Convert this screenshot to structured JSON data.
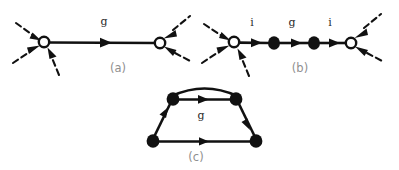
{
  "figure": {
    "background_color": "#ffffff",
    "ink_color": "#111111",
    "caption_color": "#8f8f8f",
    "label_color": "#2b2b2b",
    "width": 399,
    "height": 170
  },
  "panels": [
    {
      "id": "a",
      "caption": "(a)",
      "caption_x": 118,
      "caption_y": 72,
      "description": "two open vertices joined by a single directed edge labelled g",
      "nodes": [
        {
          "name": "open-vertex-left",
          "type": "open",
          "cx": 44,
          "cy": 42,
          "r": 5.2
        },
        {
          "name": "open-vertex-right",
          "type": "open",
          "cx": 160,
          "cy": 43,
          "r": 5.2
        }
      ],
      "edges": [
        {
          "name": "edge-g",
          "label": "g",
          "label_x": 104,
          "label_y": 25,
          "from": [
            49,
            42
          ],
          "to": [
            155,
            43
          ],
          "style": "solid",
          "arrow_at": 0.5,
          "direction": "right"
        }
      ],
      "external_legs": [
        {
          "name": "leg-in-upper-left",
          "style": "dashed",
          "from": [
            16,
            23
          ],
          "to": [
            39,
            39
          ],
          "arrow": "head-at-end"
        },
        {
          "name": "leg-in-lower-left",
          "style": "dashed",
          "from": [
            13,
            62
          ],
          "to": [
            39,
            45
          ],
          "arrow": "head-at-end"
        },
        {
          "name": "leg-in-bottom",
          "style": "dashed",
          "from": [
            58,
            73
          ],
          "to": [
            47,
            47
          ],
          "arrow": "head-at-end"
        },
        {
          "name": "leg-out-upper-right",
          "style": "dashed",
          "from": [
            165,
            40
          ],
          "to": [
            188,
            18
          ],
          "arrow": "head-at-start"
        },
        {
          "name": "leg-out-lower-right",
          "style": "dashed",
          "from": [
            165,
            46
          ],
          "to": [
            190,
            60
          ],
          "arrow": "head-at-start"
        }
      ]
    },
    {
      "id": "b",
      "caption": "(b)",
      "caption_x": 300,
      "caption_y": 72,
      "description": "open vertex, filled vertex, filled vertex, open vertex joined in a chain with edges labelled i, g, i",
      "nodes": [
        {
          "name": "open-vertex-left",
          "type": "open",
          "cx": 234,
          "cy": 42,
          "r": 5.2
        },
        {
          "name": "filled-vertex-one",
          "type": "filled",
          "cx": 274,
          "cy": 43,
          "rx": 6.0,
          "ry": 6.6
        },
        {
          "name": "filled-vertex-two",
          "type": "filled",
          "cx": 314,
          "cy": 43,
          "rx": 6.0,
          "ry": 6.6
        },
        {
          "name": "open-vertex-right",
          "type": "open",
          "cx": 351,
          "cy": 43,
          "r": 5.2
        }
      ],
      "edges": [
        {
          "name": "edge-i-left",
          "label": "i",
          "label_x": 252,
          "label_y": 26,
          "from": [
            239,
            42
          ],
          "to": [
            268,
            43
          ],
          "style": "solid",
          "arrow_at": 0.55,
          "direction": "right"
        },
        {
          "name": "edge-g-mid",
          "label": "g",
          "label_x": 292,
          "label_y": 26,
          "from": [
            280,
            43
          ],
          "to": [
            308,
            43
          ],
          "style": "solid",
          "arrow_at": 0.55,
          "direction": "right"
        },
        {
          "name": "edge-i-right",
          "label": "i",
          "label_x": 330,
          "label_y": 26,
          "from": [
            320,
            43
          ],
          "to": [
            346,
            43
          ],
          "style": "solid",
          "arrow_at": 0.55,
          "direction": "right"
        }
      ],
      "external_legs": [
        {
          "name": "leg-in-upper-left",
          "style": "dashed",
          "from": [
            204,
            24
          ],
          "to": [
            229,
            39
          ],
          "arrow": "head-at-end"
        },
        {
          "name": "leg-in-lower-left",
          "style": "dashed",
          "from": [
            202,
            62
          ],
          "to": [
            229,
            46
          ],
          "arrow": "head-at-end"
        },
        {
          "name": "leg-in-bottom",
          "style": "dashed",
          "from": [
            248,
            74
          ],
          "to": [
            237,
            48
          ],
          "arrow": "head-at-end"
        },
        {
          "name": "leg-out-upper-right",
          "style": "dashed",
          "from": [
            356,
            40
          ],
          "to": [
            379,
            16
          ],
          "arrow": "head-at-start"
        },
        {
          "name": "leg-out-lower-right",
          "style": "dashed",
          "from": [
            356,
            46
          ],
          "to": [
            382,
            60
          ],
          "arrow": "head-at-start"
        }
      ]
    },
    {
      "id": "c",
      "caption": "(c)",
      "caption_x": 196,
      "caption_y": 160,
      "description": "closed loop of four filled vertices forming a trapezoid with an extra arc across the top, inner edge labelled g",
      "nodes": [
        {
          "name": "filled-vertex-top-left",
          "type": "filled",
          "cx": 173,
          "cy": 99,
          "rx": 6.2,
          "ry": 6.6
        },
        {
          "name": "filled-vertex-top-right",
          "type": "filled",
          "cx": 236,
          "cy": 99,
          "rx": 6.2,
          "ry": 6.6
        },
        {
          "name": "filled-vertex-bottom-left",
          "type": "filled",
          "cx": 153,
          "cy": 141,
          "rx": 6.2,
          "ry": 6.6
        },
        {
          "name": "filled-vertex-bottom-right",
          "type": "filled",
          "cx": 256,
          "cy": 141,
          "rx": 6.2,
          "ry": 6.6
        }
      ],
      "edges": [
        {
          "name": "edge-top-arc",
          "label": "",
          "from": [
            173,
            99
          ],
          "to": [
            236,
            99
          ],
          "style": "arc",
          "arc_height": 12,
          "arrow_at": null,
          "direction": "none"
        },
        {
          "name": "edge-top-g",
          "label": "g",
          "label_x": 201,
          "label_y": 118,
          "from": [
            179,
            99
          ],
          "to": [
            230,
            99
          ],
          "style": "solid",
          "arrow_at": 0.5,
          "direction": "right"
        },
        {
          "name": "edge-left-side",
          "label": "",
          "from": [
            153,
            136
          ],
          "to": [
            170,
            104
          ],
          "style": "solid",
          "arrow_at": 0.5,
          "direction": "up"
        },
        {
          "name": "edge-right-side",
          "label": "",
          "from": [
            239,
            104
          ],
          "to": [
            255,
            135
          ],
          "style": "solid",
          "arrow_at": 0.5,
          "direction": "down"
        },
        {
          "name": "edge-bottom",
          "label": "",
          "from": [
            159,
            141
          ],
          "to": [
            250,
            141
          ],
          "style": "solid",
          "arrow_at": 0.5,
          "direction": "right"
        }
      ],
      "external_legs": []
    }
  ]
}
